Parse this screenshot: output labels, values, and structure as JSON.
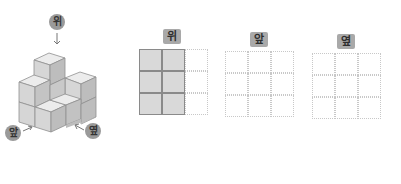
{
  "figure": {
    "labels": {
      "top": "위",
      "front": "앞",
      "side": "옆"
    },
    "colors": {
      "cube_top": "#ececec",
      "cube_front": "#d6d6d6",
      "cube_side": "#bdbdbd",
      "edge": "#8f8f8f",
      "badge": "#9a9a9a"
    }
  },
  "views": [
    {
      "label": "위",
      "rows": 3,
      "cols": 3,
      "filled": [
        [
          1,
          1,
          0
        ],
        [
          1,
          1,
          0
        ],
        [
          1,
          1,
          0
        ]
      ]
    },
    {
      "label": "앞",
      "rows": 3,
      "cols": 3,
      "filled": [
        [
          0,
          0,
          0
        ],
        [
          0,
          0,
          0
        ],
        [
          0,
          0,
          0
        ]
      ]
    },
    {
      "label": "옆",
      "rows": 3,
      "cols": 3,
      "filled": [
        [
          0,
          0,
          0
        ],
        [
          0,
          0,
          0
        ],
        [
          0,
          0,
          0
        ]
      ]
    }
  ]
}
